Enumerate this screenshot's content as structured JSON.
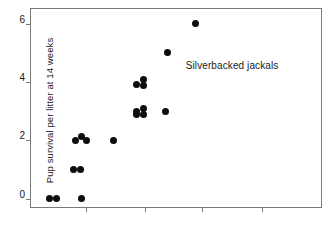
{
  "chart_data": {
    "type": "scatter",
    "title": "",
    "annotation": "Silverbacked jackals",
    "xlabel": "",
    "ylabel": "Pup survival per litter at 14 weeks",
    "ylim": [
      -0.35,
      6.5
    ],
    "yticks": [
      0,
      2,
      4,
      6
    ],
    "ytick_labels": [
      "0",
      "2",
      "4",
      "6"
    ],
    "xlim": [
      0,
      10
    ],
    "xticks": [
      1.9,
      3.9,
      5.85,
      7.9
    ],
    "xtick_labels": [
      "",
      "",
      "",
      ""
    ],
    "grid": false,
    "legend": "none",
    "marker": "filled-circle",
    "marker_color": "#0d0d0d",
    "frame_color": "#77797b",
    "points": [
      {
        "x": 0.62,
        "y": 0
      },
      {
        "x": 0.86,
        "y": 0
      },
      {
        "x": 1.72,
        "y": 0
      },
      {
        "x": 1.44,
        "y": 1
      },
      {
        "x": 1.68,
        "y": 1
      },
      {
        "x": 1.52,
        "y": 2
      },
      {
        "x": 1.72,
        "y": 2.12
      },
      {
        "x": 1.9,
        "y": 2
      },
      {
        "x": 2.82,
        "y": 2
      },
      {
        "x": 3.62,
        "y": 3
      },
      {
        "x": 3.84,
        "y": 3.1
      },
      {
        "x": 3.62,
        "y": 2.88
      },
      {
        "x": 3.84,
        "y": 2.88
      },
      {
        "x": 4.6,
        "y": 3
      },
      {
        "x": 3.6,
        "y": 3.92
      },
      {
        "x": 3.84,
        "y": 4.08
      },
      {
        "x": 3.84,
        "y": 3.88
      },
      {
        "x": 4.66,
        "y": 5
      },
      {
        "x": 5.62,
        "y": 6
      }
    ]
  }
}
